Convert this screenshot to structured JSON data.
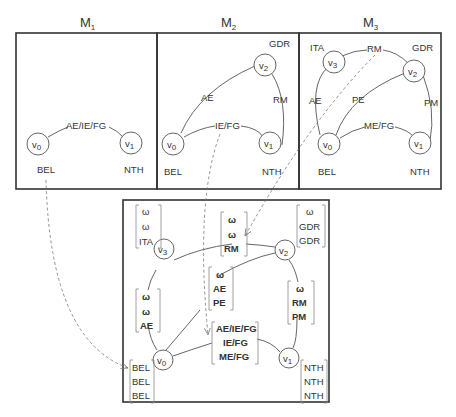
{
  "panels": [
    {
      "id": "M1",
      "title": "M",
      "subscript": "1",
      "nodes": [
        {
          "id": "v0",
          "label": "v",
          "sub": "0",
          "region": "BEL"
        },
        {
          "id": "v1",
          "label": "v",
          "sub": "1",
          "region": "NTH"
        }
      ],
      "edges": [
        {
          "from": "v0",
          "to": "v1",
          "label": "AE/IE/FG"
        }
      ]
    },
    {
      "id": "M2",
      "title": "M",
      "subscript": "2",
      "nodes": [
        {
          "id": "v0",
          "label": "v",
          "sub": "0",
          "region": "BEL"
        },
        {
          "id": "v1",
          "label": "v",
          "sub": "1",
          "region": "NTH"
        },
        {
          "id": "v2",
          "label": "v",
          "sub": "2",
          "region": "GDR"
        }
      ],
      "edges": [
        {
          "from": "v0",
          "to": "v2",
          "label": "AE"
        },
        {
          "from": "v2",
          "to": "v1",
          "label": "RM"
        },
        {
          "from": "v0",
          "to": "v1",
          "label": "IE/FG"
        }
      ]
    },
    {
      "id": "M3",
      "title": "M",
      "subscript": "3",
      "nodes": [
        {
          "id": "v0",
          "label": "v",
          "sub": "0",
          "region": "BEL"
        },
        {
          "id": "v1",
          "label": "v",
          "sub": "1",
          "region": "NTH"
        },
        {
          "id": "v2",
          "label": "v",
          "sub": "2",
          "region": "GDR"
        },
        {
          "id": "v3",
          "label": "v",
          "sub": "3",
          "region": "ITA"
        }
      ],
      "edges": [
        {
          "from": "v0",
          "to": "v3",
          "label": "AE"
        },
        {
          "from": "v3",
          "to": "v2",
          "label": "RM"
        },
        {
          "from": "v0",
          "to": "v2",
          "label": "PE"
        },
        {
          "from": "v2",
          "to": "v1",
          "label": "PM"
        },
        {
          "from": "v0",
          "to": "v1",
          "label": "ME/FG"
        }
      ]
    }
  ],
  "merged": {
    "nodes": [
      {
        "id": "v0",
        "label": "v",
        "sub": "0",
        "vector": [
          "BEL",
          "BEL",
          "BEL"
        ]
      },
      {
        "id": "v1",
        "label": "v",
        "sub": "1",
        "vector": [
          "NTH",
          "NTH",
          "NTH"
        ]
      },
      {
        "id": "v2",
        "label": "v",
        "sub": "2",
        "vector": [
          "ω",
          "GDR",
          "GDR"
        ]
      },
      {
        "id": "v3",
        "label": "v",
        "sub": "3",
        "vector": [
          "ω",
          "ω",
          "ITA"
        ]
      }
    ],
    "edges": [
      {
        "from": "v3",
        "to": "v2",
        "vector": [
          "ω",
          "ω",
          "RM"
        ]
      },
      {
        "from": "v0",
        "to": "v3",
        "vector": [
          "ω",
          "ω",
          "AE"
        ]
      },
      {
        "from": "v0",
        "to": "v2",
        "vector": [
          "ω",
          "AE",
          "PE"
        ]
      },
      {
        "from": "v2",
        "to": "v1",
        "vector": [
          "ω",
          "RM",
          "PM"
        ]
      },
      {
        "from": "v0",
        "to": "v1",
        "vector": [
          "AE/IE/FG",
          "IE/FG",
          "ME/FG"
        ]
      }
    ]
  },
  "mappings": [
    {
      "from": "M1.BEL",
      "to": "merged.v0"
    },
    {
      "from": "M2.IE/FG",
      "to": "merged.v0-v1"
    },
    {
      "from": "M3.RM",
      "to": "merged.v3-v2"
    }
  ]
}
